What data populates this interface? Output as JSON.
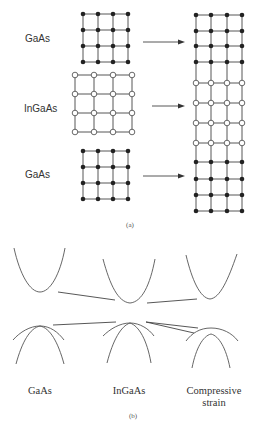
{
  "panel_a": {
    "caption": "(a)",
    "labels": {
      "top": "GaAs",
      "middle": "InGaAs",
      "bottom": "GaAs"
    },
    "left_lattices": [
      {
        "material": "GaAs",
        "atom": "filled",
        "cols": [
          83,
          98,
          113,
          128
        ],
        "rows": [
          14,
          30,
          46,
          62
        ]
      },
      {
        "material": "InGaAs",
        "atom": "open",
        "cols": [
          75,
          94,
          113,
          132
        ],
        "rows": [
          75,
          94,
          113,
          132
        ]
      },
      {
        "material": "GaAs",
        "atom": "filled",
        "cols": [
          83,
          98,
          113,
          128
        ],
        "rows": [
          151,
          167,
          183,
          199
        ]
      }
    ],
    "right_stack": {
      "cols": [
        196,
        211,
        227,
        242
      ],
      "filled_rows_top": [
        15,
        31,
        46,
        62
      ],
      "open_rows": [
        83,
        103,
        123,
        143
      ],
      "filled_rows_bottom": [
        162,
        179,
        195,
        211
      ]
    },
    "arrows": [
      {
        "from": [
          143,
          42
        ],
        "to": [
          185,
          42
        ]
      },
      {
        "from": [
          152,
          106
        ],
        "to": [
          185,
          106
        ]
      },
      {
        "from": [
          143,
          176
        ],
        "to": [
          185,
          176
        ]
      }
    ]
  },
  "panel_b": {
    "caption": "(b)",
    "labels": {
      "left": "GaAs",
      "middle": "InGaAs",
      "right_line1": "Compressive",
      "right_line2": "strain"
    }
  }
}
